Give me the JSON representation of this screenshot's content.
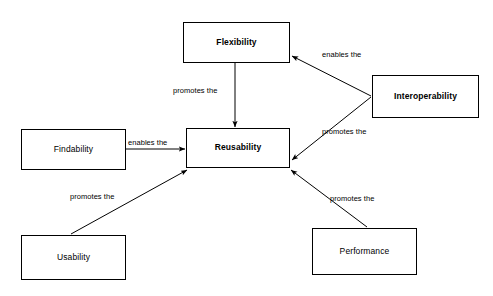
{
  "diagram": {
    "background_color": "#ffffff",
    "line_color": "#000000",
    "text_color": "#000000",
    "nodes": [
      {
        "id": "flexibility",
        "label": "Flexibility",
        "emphasis": "bold",
        "x": 183,
        "y": 22,
        "width": 107,
        "height": 41
      },
      {
        "id": "interoperability",
        "label": "Interoperability",
        "emphasis": "bold",
        "x": 372,
        "y": 75,
        "width": 107,
        "height": 43
      },
      {
        "id": "findability",
        "label": "Findability",
        "emphasis": "normal",
        "x": 21,
        "y": 129,
        "width": 105,
        "height": 41
      },
      {
        "id": "reusability",
        "label": "Reusability",
        "emphasis": "bold",
        "x": 186,
        "y": 128,
        "width": 104,
        "height": 40
      },
      {
        "id": "usability",
        "label": "Usability",
        "emphasis": "normal",
        "x": 21,
        "y": 235,
        "width": 105,
        "height": 45
      },
      {
        "id": "performance",
        "label": "Performance",
        "emphasis": "normal",
        "x": 312,
        "y": 228,
        "width": 105,
        "height": 47
      }
    ],
    "edges": [
      {
        "id": "flexibility-to-reusability",
        "from": "flexibility",
        "to": "reusability",
        "label": "promotes the",
        "label_x": 173,
        "label_y": 86,
        "x1": 235,
        "y1": 63,
        "x2": 235,
        "y2": 127
      },
      {
        "id": "findability-to-reusability",
        "from": "findability",
        "to": "reusability",
        "label": "enables the",
        "label_x": 128,
        "label_y": 138,
        "x1": 126,
        "y1": 149,
        "x2": 185,
        "y2": 149
      },
      {
        "id": "interoperability-to-flexibility",
        "from": "interoperability",
        "to": "flexibility",
        "label": "enables the",
        "label_x": 322,
        "label_y": 50,
        "x1": 371,
        "y1": 96,
        "x2": 292,
        "y2": 56
      },
      {
        "id": "interoperability-to-reusability",
        "from": "interoperability",
        "to": "reusability",
        "label": "promotes the",
        "label_x": 322,
        "label_y": 127,
        "x1": 371,
        "y1": 97,
        "x2": 292,
        "y2": 160
      },
      {
        "id": "usability-to-reusability",
        "from": "usability",
        "to": "reusability",
        "label": "promotes the",
        "label_x": 70,
        "label_y": 192,
        "x1": 71,
        "y1": 234,
        "x2": 187,
        "y2": 170
      },
      {
        "id": "performance-to-reusability",
        "from": "performance",
        "to": "reusability",
        "label": "promotes the",
        "label_x": 330,
        "label_y": 194,
        "x1": 367,
        "y1": 227,
        "x2": 291,
        "y2": 170
      }
    ]
  }
}
